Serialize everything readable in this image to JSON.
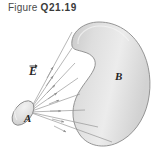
{
  "figure": {
    "caption_word": "Figure",
    "caption_number": "Q21.19",
    "labels": {
      "field_vector": "E",
      "source_surface": "A",
      "target_surface": "B"
    },
    "colors": {
      "blob_fill_light": "#f0f0f0",
      "blob_fill_mid": "#d8d8d8",
      "blob_fill_dark": "#c4c4c4",
      "blob_outline": "#8a8a8a",
      "field_line": "#8f8f8f",
      "caption_text": "#4a4a4a",
      "label_text": "#262626",
      "background": "#ffffff"
    },
    "field_line_count": 8
  }
}
